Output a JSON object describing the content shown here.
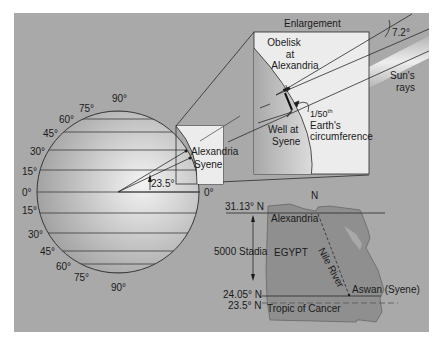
{
  "colors": {
    "panel_bg": "#a9a9a9",
    "globe_light": "#f2f2f2",
    "globe_dark": "#9a9a9a",
    "box_bg": "#ebebeb",
    "egypt_fill": "#8f8f8f",
    "line": "#2a2a2a"
  },
  "globe": {
    "north_labels": [
      "90°",
      "75°",
      "60°",
      "45°",
      "30°",
      "15°"
    ],
    "equator_label_left": "0°",
    "equator_label_right": "0°",
    "south_labels": [
      "15°",
      "30°",
      "45°",
      "60°",
      "75°",
      "90°"
    ],
    "angle_label": "23.5°",
    "point_alexandria": "Alexandria",
    "point_syene": "Syene"
  },
  "enlargement": {
    "title": "Enlargement",
    "obelisk_label": [
      "Obelisk",
      "at",
      "Alexandria"
    ],
    "well_label": [
      "Well at",
      "Syene"
    ],
    "fraction_label": "1/50",
    "fraction_sup": "th",
    "circumference_label": [
      "Earth's",
      "circumference"
    ],
    "angle_label": "7.2°",
    "sun_rays_label": [
      "Sun's",
      "rays"
    ]
  },
  "map": {
    "north_label": "N",
    "lat_alexandria": "31.13° N",
    "lat_aswan": "24.05° N",
    "lat_tropic": "23.5° N",
    "distance_label": "5000 Stadia",
    "city_alexandria": "Alexandria",
    "city_aswan": "Aswan (Syene)",
    "country": "EGYPT",
    "river": "Nile River",
    "tropic": "Tropic of Cancer"
  }
}
